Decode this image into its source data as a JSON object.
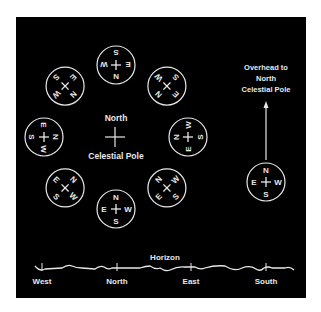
{
  "colors": {
    "background": "#000000",
    "page": "#ffffff",
    "foreground": "#e8e8e8"
  },
  "pole_label": {
    "line1": "North",
    "line2": "Celestial Pole"
  },
  "overhead_label": {
    "line1": "Overhead to",
    "line2": "North",
    "line3": "Celestial Pole"
  },
  "horizon": {
    "title": "Horizon",
    "directions": [
      "West",
      "North",
      "East",
      "South"
    ]
  },
  "compass_letters": {
    "north": "N",
    "east": "E",
    "south": "S",
    "west": "W"
  },
  "ring_positions_deg": [
    0,
    45,
    90,
    135,
    180,
    225,
    270,
    315
  ],
  "side_compass": {
    "orientation": "upright"
  }
}
